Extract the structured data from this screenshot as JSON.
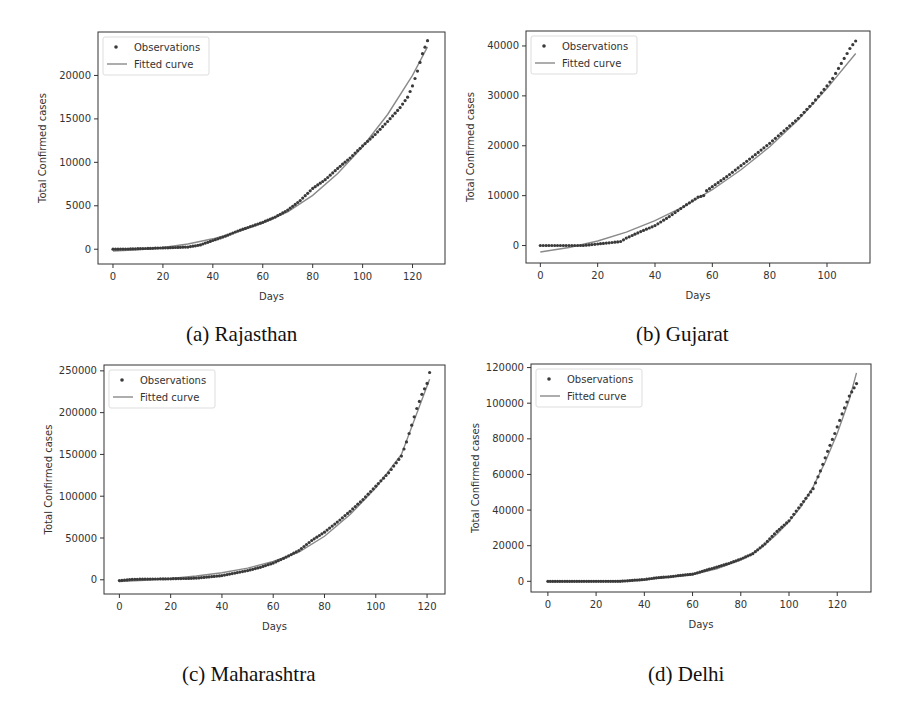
{
  "figure": {
    "panels": [
      {
        "id": "a",
        "caption": "(a) Rajasthan"
      },
      {
        "id": "b",
        "caption": "(b) Gujarat"
      },
      {
        "id": "c",
        "caption": "(c) Maharashtra"
      },
      {
        "id": "d",
        "caption": "(d) Delhi"
      }
    ]
  },
  "colors": {
    "observations": "#3a3a3a",
    "fitted_curve": "#8a8a8a",
    "frame": "#333333",
    "legend_border": "#dddddd"
  },
  "chart_data": [
    {
      "type": "scatter",
      "title": "(a) Rajasthan",
      "xlabel": "Days",
      "ylabel": "Total Confirmed cases",
      "xlim": [
        -6,
        133
      ],
      "ylim": [
        -1700,
        25000
      ],
      "xticks": [
        0,
        20,
        40,
        60,
        80,
        100,
        120
      ],
      "yticks": [
        0,
        5000,
        10000,
        15000,
        20000
      ],
      "legend": [
        "Observations",
        "Fitted curve"
      ],
      "legend_position": "upper left",
      "grid": false,
      "series": [
        {
          "name": "Observations",
          "kind": "scatter",
          "x": [
            0,
            5,
            10,
            15,
            20,
            25,
            30,
            35,
            40,
            45,
            50,
            55,
            60,
            65,
            70,
            75,
            80,
            85,
            90,
            95,
            100,
            105,
            110,
            115,
            118,
            120,
            122,
            124,
            126
          ],
          "y": [
            0,
            20,
            60,
            100,
            150,
            200,
            250,
            500,
            1000,
            1500,
            2100,
            2600,
            3100,
            3700,
            4500,
            5600,
            7000,
            8000,
            9300,
            10500,
            11900,
            13200,
            14700,
            16300,
            17500,
            18800,
            20500,
            22500,
            24000
          ]
        },
        {
          "name": "Fitted curve",
          "kind": "line",
          "x": [
            0,
            10,
            20,
            30,
            40,
            50,
            60,
            70,
            80,
            90,
            100,
            110,
            120,
            126
          ],
          "y": [
            -200,
            -50,
            200,
            600,
            1200,
            2000,
            3000,
            4300,
            6200,
            8700,
            11800,
            15500,
            20000,
            23300
          ]
        }
      ]
    },
    {
      "type": "scatter",
      "title": "(b) Gujarat",
      "xlabel": "Days",
      "ylabel": "Total Confirmed cases",
      "xlim": [
        -5,
        115
      ],
      "ylim": [
        -3500,
        43000
      ],
      "xticks": [
        0,
        20,
        40,
        60,
        80,
        100
      ],
      "yticks": [
        0,
        10000,
        20000,
        30000,
        40000
      ],
      "legend": [
        "Observations",
        "Fitted curve"
      ],
      "legend_position": "upper left",
      "grid": false,
      "series": [
        {
          "name": "Observations",
          "kind": "scatter",
          "x": [
            0,
            5,
            10,
            15,
            20,
            25,
            28,
            30,
            35,
            40,
            45,
            50,
            55,
            57,
            58,
            60,
            65,
            70,
            75,
            80,
            85,
            90,
            95,
            100,
            102,
            104,
            106,
            108,
            110
          ],
          "y": [
            0,
            0,
            0,
            0,
            300,
            600,
            800,
            1500,
            2800,
            4000,
            5800,
            7800,
            9700,
            10000,
            11000,
            11800,
            13800,
            16000,
            18200,
            20500,
            23000,
            25500,
            28500,
            32000,
            33500,
            35500,
            37500,
            39500,
            41000
          ]
        },
        {
          "name": "Fitted curve",
          "kind": "line",
          "x": [
            0,
            10,
            20,
            30,
            40,
            50,
            60,
            70,
            80,
            90,
            100,
            110
          ],
          "y": [
            -1300,
            -400,
            900,
            2700,
            5000,
            7800,
            11200,
            15200,
            19800,
            25200,
            31500,
            38500
          ]
        }
      ]
    },
    {
      "type": "scatter",
      "title": "(c) Maharashtra",
      "xlabel": "Days",
      "ylabel": "Total Confirmed cases",
      "xlim": [
        -6,
        127
      ],
      "ylim": [
        -17000,
        257000
      ],
      "xticks": [
        0,
        20,
        40,
        60,
        80,
        100,
        120
      ],
      "yticks": [
        0,
        50000,
        100000,
        150000,
        200000,
        250000
      ],
      "legend": [
        "Observations",
        "Fitted curve"
      ],
      "legend_position": "upper left",
      "grid": false,
      "series": [
        {
          "name": "Observations",
          "kind": "scatter",
          "x": [
            0,
            5,
            10,
            15,
            20,
            25,
            30,
            35,
            40,
            45,
            50,
            55,
            60,
            65,
            70,
            75,
            80,
            85,
            90,
            95,
            100,
            105,
            108,
            110,
            112,
            114,
            116,
            118,
            120,
            121
          ],
          "y": [
            -1000,
            500,
            800,
            1000,
            1200,
            1500,
            2000,
            3500,
            5000,
            8000,
            11000,
            15000,
            20000,
            27000,
            35000,
            47000,
            57000,
            69000,
            82000,
            96000,
            112000,
            128000,
            140000,
            148000,
            165000,
            185000,
            205000,
            222000,
            235000,
            248000
          ]
        },
        {
          "name": "Fitted curve",
          "kind": "line",
          "x": [
            0,
            10,
            20,
            30,
            40,
            50,
            60,
            70,
            80,
            90,
            100,
            110,
            121
          ],
          "y": [
            -2000,
            -500,
            1500,
            4500,
            8500,
            14000,
            22000,
            33000,
            52000,
            78000,
            110000,
            150000,
            240000
          ]
        }
      ]
    },
    {
      "type": "scatter",
      "title": "(d) Delhi",
      "xlabel": "Days",
      "ylabel": "Total Confirmed cases",
      "xlim": [
        -7,
        134
      ],
      "ylim": [
        -6000,
        122000
      ],
      "xticks": [
        0,
        20,
        40,
        60,
        80,
        100,
        120
      ],
      "yticks": [
        0,
        20000,
        40000,
        60000,
        80000,
        100000,
        120000
      ],
      "legend": [
        "Observations",
        "Fitted curve"
      ],
      "legend_position": "upper left",
      "grid": false,
      "series": [
        {
          "name": "Observations",
          "kind": "scatter",
          "x": [
            0,
            5,
            10,
            15,
            20,
            25,
            30,
            35,
            40,
            45,
            50,
            55,
            60,
            65,
            70,
            75,
            80,
            85,
            90,
            95,
            100,
            105,
            110,
            113,
            116,
            119,
            122,
            125,
            128
          ],
          "y": [
            0,
            0,
            0,
            0,
            0,
            0,
            0,
            500,
            1000,
            2000,
            2500,
            3300,
            4000,
            6000,
            8000,
            10000,
            12500,
            15500,
            21000,
            28000,
            34000,
            43000,
            52000,
            62000,
            73000,
            83000,
            94000,
            104000,
            111000
          ]
        },
        {
          "name": "Fitted curve",
          "kind": "line",
          "x": [
            0,
            20,
            40,
            60,
            70,
            80,
            85,
            90,
            95,
            100,
            105,
            110,
            115,
            120,
            125,
            128
          ],
          "y": [
            -200,
            0,
            800,
            3800,
            7000,
            12000,
            15500,
            20500,
            26500,
            33500,
            42000,
            53000,
            67000,
            83000,
            102000,
            117000
          ]
        }
      ]
    }
  ]
}
